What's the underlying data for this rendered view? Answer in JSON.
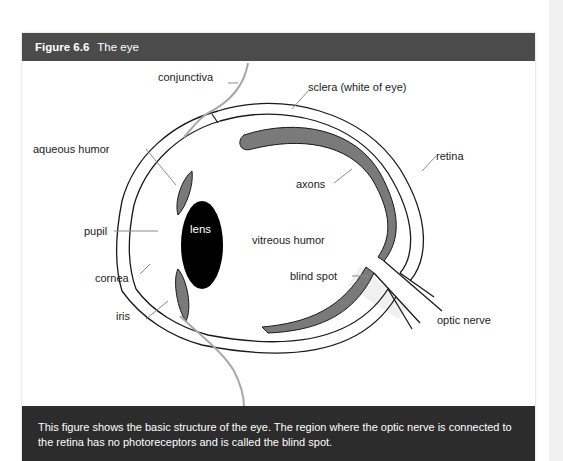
{
  "figure": {
    "number": "Figure 6.6",
    "title": "The eye",
    "caption": "This figure shows the basic structure of the eye. The region where the optic nerve is connected to the retina has no photoreceptors and is called the blind spot."
  },
  "diagram": {
    "labels": {
      "conjunctiva": "conjunctiva",
      "sclera": "sclera (white of eye)",
      "aqueous_humor": "aqueous humor",
      "axons": "axons",
      "retina": "retina",
      "pupil": "pupil",
      "lens": "lens",
      "vitreous_humor": "vitreous humor",
      "cornea": "cornea",
      "blind_spot": "blind spot",
      "iris": "iris",
      "optic_nerve": "optic nerve"
    },
    "colors": {
      "outline": "#1a1a1a",
      "retina_fill": "#7a7a7a",
      "lens_fill": "#000000",
      "conjunctiva_stroke": "#a8a8a8",
      "leader_line": "#8a8a8a",
      "optic_nerve_fill": "#f0f0f0"
    }
  }
}
